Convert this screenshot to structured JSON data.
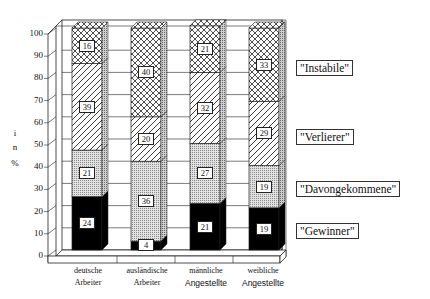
{
  "chart_data": {
    "type": "bar",
    "stacked": true,
    "three_d": true,
    "title": "",
    "xlabel": "",
    "ylabel": "i n %",
    "ylim": [
      0,
      100
    ],
    "yticks": [
      0,
      10,
      20,
      30,
      40,
      50,
      60,
      70,
      80,
      90,
      100
    ],
    "grid": true,
    "legend_position": "right (labels aligned to segments)",
    "categories": [
      [
        "deutsche",
        "Arbeiter"
      ],
      [
        "ausländische",
        "Arbeiter"
      ],
      [
        "männliche",
        "Angestellte"
      ],
      [
        "weibliche",
        "Angestellte"
      ]
    ],
    "series": [
      {
        "name": "\"Gewinner\"",
        "pattern": "solid-black",
        "values": [
          24,
          4,
          21,
          19
        ]
      },
      {
        "name": "\"Davongekommene\"",
        "pattern": "fine-dots-gray",
        "values": [
          21,
          36,
          27,
          19
        ]
      },
      {
        "name": "\"Verlierer\"",
        "pattern": "diagonal-hatch",
        "values": [
          39,
          20,
          32,
          29
        ]
      },
      {
        "name": "\"Instabile\"",
        "pattern": "cross-hatch",
        "values": [
          16,
          40,
          21,
          33
        ]
      }
    ]
  },
  "axis": {
    "ylabel_lines": [
      "i",
      "n",
      "%"
    ],
    "ticks": [
      "0",
      "10",
      "20",
      "30",
      "40",
      "50",
      "60",
      "70",
      "80",
      "90",
      "100"
    ]
  },
  "categories": [
    {
      "line1": "deutsche",
      "line2": "Arbeiter"
    },
    {
      "line1": "ausländische",
      "line2": "Arbeiter"
    },
    {
      "line1": "männliche",
      "line2": "Angestellte"
    },
    {
      "line1": "weibliche",
      "line2": "Angestellte"
    }
  ],
  "legend": {
    "instabile": "\"Instabile\"",
    "verlierer": "\"Verlierer\"",
    "davongekommene": "\"Davongekommene\"",
    "gewinner": "\"Gewinner\""
  },
  "bars": [
    {
      "gewinner": "24",
      "davongekommene": "21",
      "verlierer": "39",
      "instabile": "16"
    },
    {
      "gewinner": "4",
      "davongekommene": "36",
      "verlierer": "20",
      "instabile": "40"
    },
    {
      "gewinner": "21",
      "davongekommene": "27",
      "verlierer": "32",
      "instabile": "21"
    },
    {
      "gewinner": "19",
      "davongekommene": "19",
      "verlierer": "29",
      "instabile": "33"
    }
  ]
}
